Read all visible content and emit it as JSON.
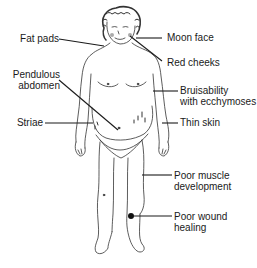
{
  "diagram": {
    "line_color": "#1a1a1a",
    "labels_left": [
      {
        "id": "fat-pads",
        "lines": [
          "Fat pads"
        ]
      },
      {
        "id": "pendulous-abdomen",
        "lines": [
          "Pendulous",
          "abdomen"
        ]
      },
      {
        "id": "striae",
        "lines": [
          "Striae"
        ]
      }
    ],
    "labels_right": [
      {
        "id": "moon-face",
        "lines": [
          "Moon face"
        ]
      },
      {
        "id": "red-cheeks",
        "lines": [
          "Red cheeks"
        ]
      },
      {
        "id": "bruisability",
        "lines": [
          "Bruisability",
          "with ecchymoses"
        ]
      },
      {
        "id": "thin-skin",
        "lines": [
          "Thin skin"
        ]
      },
      {
        "id": "poor-muscle",
        "lines": [
          "Poor muscle",
          "development"
        ]
      },
      {
        "id": "poor-wound",
        "lines": [
          "Poor wound",
          "healing"
        ]
      }
    ]
  }
}
